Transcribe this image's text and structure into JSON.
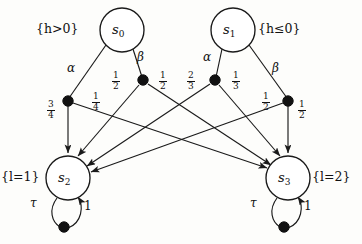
{
  "figure": {
    "kind": "probabilistic-automaton-diagram",
    "title": ""
  },
  "states": [
    {
      "id": "s0",
      "name": "s",
      "index": "0",
      "prop": "{h>0}",
      "prop_side": "left",
      "cx": 122,
      "cy": 30,
      "r": 22
    },
    {
      "id": "s1",
      "name": "s",
      "index": "1",
      "prop": "{h≤0}",
      "prop_side": "right",
      "cx": 233,
      "cy": 30,
      "r": 22
    },
    {
      "id": "s2",
      "name": "s",
      "index": "2",
      "prop": "{l=1}",
      "prop_side": "left",
      "cx": 68,
      "cy": 178,
      "r": 22
    },
    {
      "id": "s3",
      "name": "s",
      "index": "3",
      "prop": "{l=2}",
      "prop_side": "right",
      "cx": 288,
      "cy": 178,
      "r": 22
    }
  ],
  "actions": [
    {
      "id": "a0",
      "label": "α",
      "from": "s0",
      "dot": "d0",
      "x": 73,
      "y": 68
    },
    {
      "id": "a1",
      "label": "β",
      "from": "s0",
      "dot": "d1",
      "x": 140,
      "y": 57
    },
    {
      "id": "a2",
      "label": "α",
      "from": "s1",
      "dot": "d2",
      "x": 207,
      "y": 57
    },
    {
      "id": "a3",
      "label": "β",
      "from": "s1",
      "dot": "d3",
      "x": 276,
      "y": 68
    },
    {
      "id": "a4",
      "label": "τ",
      "from": "s2",
      "dot": "d4",
      "x": 32,
      "y": 202
    },
    {
      "id": "a5",
      "label": "τ",
      "from": "s3",
      "dot": "d5",
      "x": 252,
      "y": 202
    }
  ],
  "dots": [
    {
      "id": "d0",
      "cx": 68,
      "cy": 101
    },
    {
      "id": "d1",
      "cx": 143,
      "cy": 80
    },
    {
      "id": "d2",
      "cx": 215,
      "cy": 80
    },
    {
      "id": "d3",
      "cx": 288,
      "cy": 101
    },
    {
      "id": "d4",
      "cx": 64,
      "cy": 227
    },
    {
      "id": "d5",
      "cx": 284,
      "cy": 227
    }
  ],
  "transitions": [
    {
      "id": "t0",
      "from_dot": "d0",
      "to": "s2",
      "num": "3",
      "den": "4",
      "lx": 51,
      "ly": 105
    },
    {
      "id": "t1",
      "from_dot": "d0",
      "to": "s3",
      "num": "1",
      "den": "4",
      "lx": 95,
      "ly": 96
    },
    {
      "id": "t2",
      "from_dot": "d1",
      "to": "s2",
      "num": "1",
      "den": "2",
      "lx": 114,
      "ly": 76
    },
    {
      "id": "t3",
      "from_dot": "d1",
      "to": "s3",
      "num": "1",
      "den": "2",
      "lx": 161,
      "ly": 76
    },
    {
      "id": "t4",
      "from_dot": "d2",
      "to": "s2",
      "num": "2",
      "den": "3",
      "lx": 189,
      "ly": 76
    },
    {
      "id": "t5",
      "from_dot": "d2",
      "to": "s3",
      "num": "1",
      "den": "3",
      "lx": 234,
      "ly": 76
    },
    {
      "id": "t6",
      "from_dot": "d3",
      "to": "s2",
      "num": "1",
      "den": "2",
      "lx": 265,
      "ly": 97
    },
    {
      "id": "t7",
      "from_dot": "d3",
      "to": "s3",
      "num": "1",
      "den": "2",
      "lx": 300,
      "ly": 105
    },
    {
      "id": "t8",
      "from_dot": "d4",
      "to": "s2",
      "num": "1",
      "den": "",
      "lx": 85,
      "ly": 205
    },
    {
      "id": "t9",
      "from_dot": "d5",
      "to": "s3",
      "num": "1",
      "den": "",
      "lx": 305,
      "ly": 205
    }
  ],
  "colors": {
    "ink": "#1a1a1a",
    "dot": "#111111",
    "background": "#fdfdfb"
  }
}
